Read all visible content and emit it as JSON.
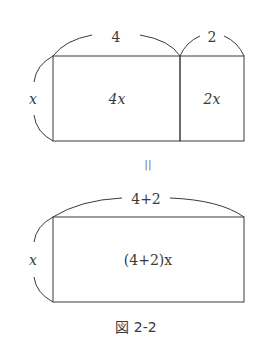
{
  "top_figure": {
    "width_label_left": "4",
    "width_label_right": "2",
    "height_label": "x",
    "area_left": "4x",
    "area_right": "2x"
  },
  "equals_sign": "||",
  "bottom_figure": {
    "width_label": "4+2",
    "height_label": "x",
    "area": "(4+2)x"
  },
  "caption": "図 2-2",
  "colors": {
    "line": "#3a3a3a",
    "background": "#ffffff"
  }
}
